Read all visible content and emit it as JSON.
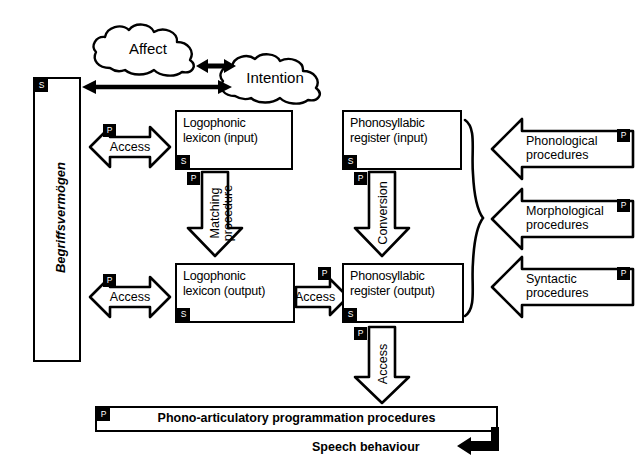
{
  "diagram": {
    "clouds": [
      {
        "id": "affect",
        "label": "Affect"
      },
      {
        "id": "intention",
        "label": "Intention"
      }
    ],
    "concept_store": {
      "label": "Begriffsvermögen",
      "badge": "S"
    },
    "boxes": [
      {
        "id": "logophonic-lexicon-input",
        "label_line1": "Logophonic",
        "label_line2": "lexicon (input)",
        "badge": "S"
      },
      {
        "id": "phonosyllabic-register-input",
        "label_line1": "Phonosyllabic",
        "label_line2": "register (input)",
        "badge": "S"
      },
      {
        "id": "logophonic-lexicon-output",
        "label_line1": "Logophonic",
        "label_line2": "lexicon (output)",
        "badge": "S"
      },
      {
        "id": "phonosyllabic-register-output",
        "label_line1": "Phonosyllabic",
        "label_line2": "register (output)",
        "badge": "S"
      }
    ],
    "arrows": [
      {
        "id": "access-input",
        "label": "Access",
        "badge": "P",
        "direction": "bidirectional"
      },
      {
        "id": "access-output",
        "label": "Access",
        "badge": "P",
        "direction": "bidirectional"
      },
      {
        "id": "access-middle",
        "label": "Access",
        "badge": "P",
        "direction": "right"
      },
      {
        "id": "matching-procedure",
        "label_line1": "Matching",
        "label_line2": "procedure",
        "badge": "P",
        "direction": "down"
      },
      {
        "id": "conversion",
        "label": "Conversion",
        "badge": "P",
        "direction": "down"
      },
      {
        "id": "access-bottom",
        "label": "Access",
        "badge": "P",
        "direction": "down"
      }
    ],
    "procedures": [
      {
        "id": "phonological-procedures",
        "label_line1": "Phonological",
        "label_line2": "procedures",
        "badge": "P"
      },
      {
        "id": "morphological-procedures",
        "label_line1": "Morphological",
        "label_line2": "procedures",
        "badge": "P"
      },
      {
        "id": "syntactic-procedures",
        "label_line1": "Syntactic",
        "label_line2": "procedures",
        "badge": "P"
      }
    ],
    "bottom_bar": {
      "label": "Phono-articulatory programmation procedures",
      "badge": "P"
    },
    "output": {
      "label": "Speech behaviour"
    },
    "colors": {
      "stroke": "#000000",
      "fill": "#ffffff",
      "badge_bg": "#000000",
      "badge_fg": "#ffffff"
    }
  }
}
